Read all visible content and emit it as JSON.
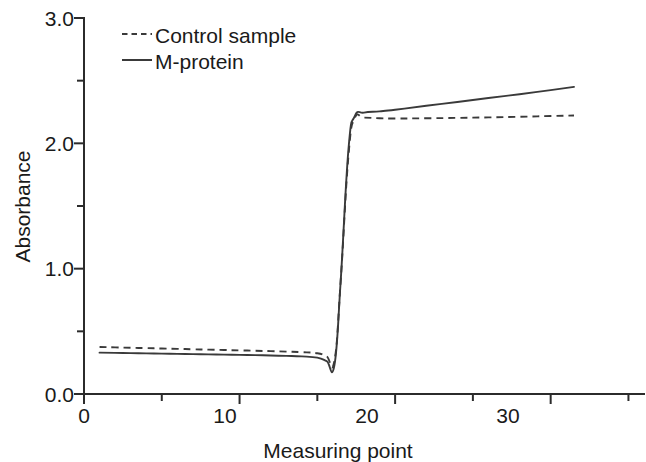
{
  "chart_data": {
    "type": "line",
    "title": "",
    "xlabel": "Measuring point",
    "ylabel": "Absorbance",
    "xlim": [
      0,
      36
    ],
    "ylim": [
      0.0,
      3.0
    ],
    "grid": false,
    "legend_position": "top-left-inside",
    "x_ticks_major": [
      0,
      10,
      20,
      30
    ],
    "x_ticks_major_labels": [
      "0",
      "10",
      "20",
      "30"
    ],
    "x_ticks_minor": [
      5,
      15,
      25,
      35
    ],
    "y_ticks_major": [
      0.0,
      1.0,
      2.0,
      3.0
    ],
    "y_ticks_major_labels": [
      "0.0",
      "1.0",
      "2.0",
      "3.0"
    ],
    "y_ticks_minor": [
      0.5,
      1.5,
      2.5
    ],
    "x": [
      1,
      2,
      3,
      4,
      5,
      6,
      7,
      8,
      9,
      10,
      11,
      12,
      13,
      14,
      15,
      15.6,
      16.1,
      16.5,
      17.0,
      17.4,
      18,
      19,
      20,
      22,
      24,
      26,
      28,
      30,
      31.5
    ],
    "series": [
      {
        "name": "Control sample",
        "style": "dashed",
        "color": "#3a3a3a",
        "values": [
          0.375,
          0.372,
          0.369,
          0.366,
          0.363,
          0.36,
          0.357,
          0.354,
          0.351,
          0.348,
          0.345,
          0.342,
          0.338,
          0.334,
          0.325,
          0.3,
          0.265,
          0.9,
          1.9,
          2.2,
          2.205,
          2.2,
          2.198,
          2.2,
          2.203,
          2.207,
          2.212,
          2.218,
          2.222
        ]
      },
      {
        "name": "M-protein",
        "style": "solid",
        "color": "#3a3a3a",
        "values": [
          0.33,
          0.328,
          0.326,
          0.324,
          0.322,
          0.32,
          0.318,
          0.316,
          0.314,
          0.312,
          0.31,
          0.307,
          0.304,
          0.3,
          0.29,
          0.262,
          0.23,
          0.9,
          1.95,
          2.215,
          2.245,
          2.255,
          2.268,
          2.3,
          2.33,
          2.362,
          2.392,
          2.425,
          2.45
        ]
      }
    ]
  },
  "legend": {
    "items": [
      {
        "label": "Control sample",
        "style": "dashed"
      },
      {
        "label": "M-protein",
        "style": "solid"
      }
    ]
  }
}
